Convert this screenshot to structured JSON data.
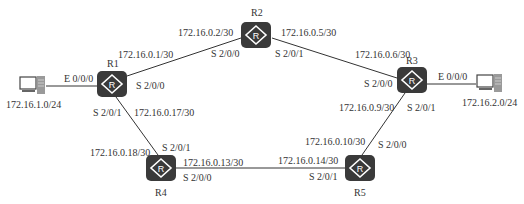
{
  "colors": {
    "router_fill": "#3a3a3a",
    "link": "#333333",
    "text": "#333333",
    "background": "#ffffff"
  },
  "routers": [
    {
      "id": "R1",
      "label": "R1"
    },
    {
      "id": "R2",
      "label": "R2"
    },
    {
      "id": "R3",
      "label": "R3"
    },
    {
      "id": "R4",
      "label": "R4"
    },
    {
      "id": "R5",
      "label": "R5"
    }
  ],
  "hosts": [
    {
      "id": "PC1",
      "network": "172.16.1.0/24",
      "icon": "pc-icon"
    },
    {
      "id": "PC2",
      "network": "172.16.2.0/24",
      "icon": "pc-icon"
    }
  ],
  "links": [
    {
      "from": "R1",
      "to": "R2",
      "from_ip": "172.16.0.1/30",
      "from_if": "S 2/0/0",
      "to_ip": "172.16.0.2/30",
      "to_if": "S 2/0/0"
    },
    {
      "from": "R2",
      "to": "R3",
      "from_ip": "172.16.0.5/30",
      "from_if": "S 2/0/1",
      "to_ip": "172.16.0.6/30",
      "to_if": "S 2/0/0"
    },
    {
      "from": "R3",
      "to": "R5",
      "from_ip": "172.16.0.9/30",
      "from_if": "S 2/0/1",
      "to_ip": "172.16.0.10/30",
      "to_if": "S 2/0/0"
    },
    {
      "from": "R5",
      "to": "R4",
      "from_ip": "172.16.0.14/30",
      "from_if": "S 2/0/1",
      "to_ip": "172.16.0.13/30",
      "to_if": "S 2/0/0"
    },
    {
      "from": "R4",
      "to": "R1",
      "from_ip": "172.16.0.18/30",
      "from_if": "S 2/0/1",
      "to_ip": "172.16.0.17/30",
      "to_if": "S 2/0/1"
    },
    {
      "from": "PC1",
      "to": "R1",
      "to_if": "E 0/0/0"
    },
    {
      "from": "PC2",
      "to": "R3",
      "to_if": "E 0/0/0"
    }
  ],
  "router_glyph": "R"
}
